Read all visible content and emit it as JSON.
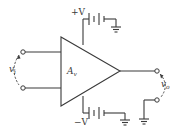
{
  "diagram": {
    "type": "amplifier-circuit",
    "amplifier": {
      "label": "A",
      "label_subscript": "v"
    },
    "supply_positive": {
      "label": "+V"
    },
    "supply_negative": {
      "label": "−V"
    },
    "input": {
      "label": "v",
      "label_subscript": "i"
    },
    "output": {
      "label": "v",
      "label_subscript": "o"
    },
    "colors": {
      "stroke": "#3a3a3a",
      "background": "#ffffff"
    }
  }
}
